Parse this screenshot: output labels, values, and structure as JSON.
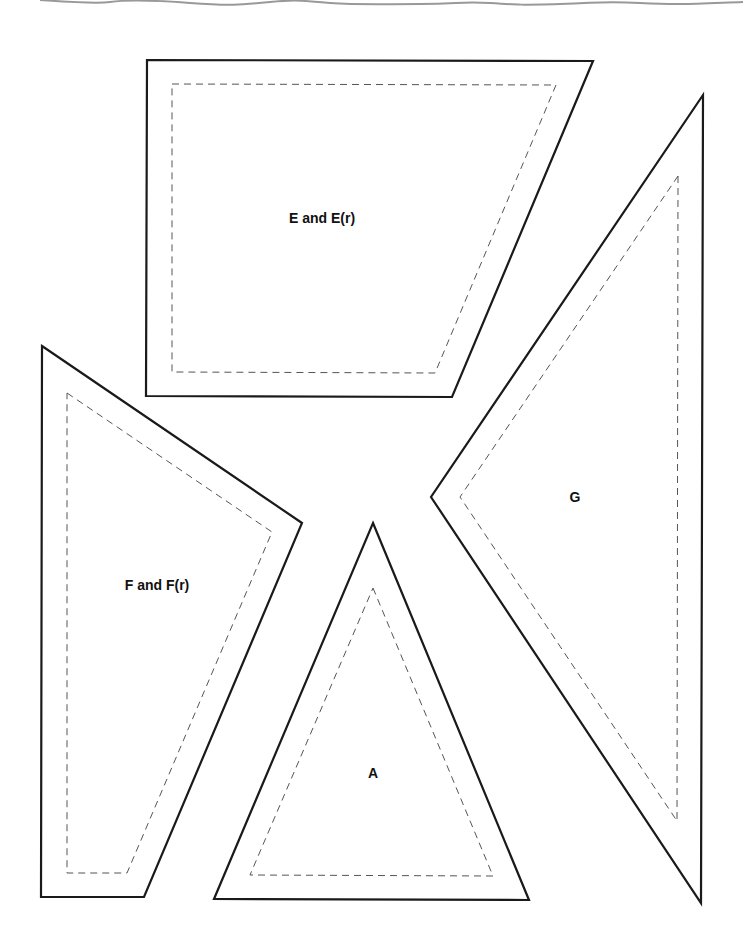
{
  "page": {
    "background": "#ffffff",
    "outline_color": "#1a1a1a",
    "seam_color": "#555555",
    "tear_edge_color": "#999999"
  },
  "pieces": [
    {
      "id": "E",
      "label": "E and E(r)",
      "label_pos": [
        322,
        218
      ],
      "outer": [
        [
          147,
          60
        ],
        [
          593,
          61
        ],
        [
          452,
          397
        ],
        [
          146,
          396
        ]
      ],
      "inner": [
        [
          172,
          84
        ],
        [
          556,
          85
        ],
        [
          435,
          373
        ],
        [
          172,
          372
        ]
      ]
    },
    {
      "id": "G",
      "label": "G",
      "label_pos": [
        575,
        497
      ],
      "outer": [
        [
          703,
          95
        ],
        [
          701,
          903
        ],
        [
          431,
          497
        ]
      ],
      "inner": [
        [
          678,
          176
        ],
        [
          677,
          821
        ],
        [
          460,
          497
        ]
      ]
    },
    {
      "id": "F",
      "label": "F and F(r)",
      "label_pos": [
        157,
        585
      ],
      "outer": [
        [
          42,
          346
        ],
        [
          302,
          523
        ],
        [
          144,
          897
        ],
        [
          41,
          897
        ]
      ],
      "inner": [
        [
          67,
          393
        ],
        [
          272,
          532
        ],
        [
          127,
          873
        ],
        [
          67,
          873
        ]
      ]
    },
    {
      "id": "A",
      "label": "A",
      "label_pos": [
        373,
        773
      ],
      "outer": [
        [
          373,
          523
        ],
        [
          529,
          900
        ],
        [
          214,
          899
        ]
      ],
      "inner": [
        [
          373,
          588
        ],
        [
          493,
          876
        ],
        [
          250,
          875
        ]
      ]
    }
  ]
}
